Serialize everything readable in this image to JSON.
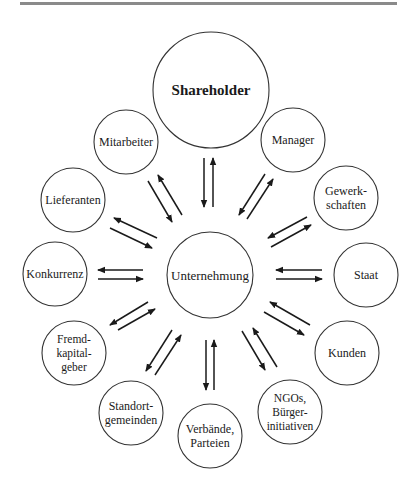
{
  "diagram": {
    "center": {
      "label": "Unternehmung",
      "x": 210,
      "y": 275,
      "r": 43
    },
    "shareholder": {
      "label": "Shareholder",
      "x": 211,
      "y": 90,
      "r": 58,
      "bold": true
    },
    "stakeholders": [
      {
        "id": "mitarbeiter",
        "lines": [
          "Mitarbeiter"
        ],
        "x": 126,
        "y": 142,
        "r": 32
      },
      {
        "id": "manager",
        "lines": [
          "Manager"
        ],
        "x": 293,
        "y": 140,
        "r": 32
      },
      {
        "id": "lieferanten",
        "lines": [
          "Lieferanten"
        ],
        "x": 73,
        "y": 200,
        "r": 32
      },
      {
        "id": "gewerkschaften",
        "lines": [
          "Gewerk-",
          "schaften"
        ],
        "x": 346,
        "y": 198,
        "r": 32
      },
      {
        "id": "konkurrenz",
        "lines": [
          "Konkurrenz"
        ],
        "x": 55,
        "y": 274,
        "r": 32
      },
      {
        "id": "staat",
        "lines": [
          "Staat"
        ],
        "x": 366,
        "y": 275,
        "r": 32
      },
      {
        "id": "fremdkapitalgeber",
        "lines": [
          "Fremd-",
          "kapital-",
          "geber"
        ],
        "x": 74,
        "y": 353,
        "r": 32
      },
      {
        "id": "kunden",
        "lines": [
          "Kunden"
        ],
        "x": 347,
        "y": 353,
        "r": 32
      },
      {
        "id": "standortgemeinden",
        "lines": [
          "Standort-",
          "gemeinden"
        ],
        "x": 131,
        "y": 413,
        "r": 32
      },
      {
        "id": "verbaende",
        "lines": [
          "Verbände,",
          "Parteien"
        ],
        "x": 210,
        "y": 436,
        "r": 32
      },
      {
        "id": "ngos",
        "lines": [
          "NGOs,",
          "Bürger-",
          "initiativen"
        ],
        "x": 290,
        "y": 412,
        "r": 32
      }
    ],
    "arrows": [
      {
        "from": "shareholder",
        "x1": 204,
        "y1": 158,
        "x2": 204,
        "y2": 207
      },
      {
        "from": "unternehmung",
        "x1": 213,
        "y1": 207,
        "x2": 213,
        "y2": 158
      },
      {
        "from": "mitarbeiter",
        "x1": 148,
        "y1": 181,
        "x2": 172,
        "y2": 222
      },
      {
        "from": "unternehmung",
        "x1": 182,
        "y1": 215,
        "x2": 158,
        "y2": 175
      },
      {
        "from": "manager",
        "x1": 265,
        "y1": 174,
        "x2": 239,
        "y2": 215
      },
      {
        "from": "unternehmung",
        "x1": 247,
        "y1": 219,
        "x2": 273,
        "y2": 179
      },
      {
        "from": "unternehmung",
        "x1": 157,
        "y1": 238,
        "x2": 114,
        "y2": 218
      },
      {
        "from": "lieferanten",
        "x1": 110,
        "y1": 228,
        "x2": 152,
        "y2": 248
      },
      {
        "from": "gewerkschaften",
        "x1": 307,
        "y1": 217,
        "x2": 268,
        "y2": 238
      },
      {
        "from": "unternehmung",
        "x1": 271,
        "y1": 247,
        "x2": 311,
        "y2": 225
      },
      {
        "from": "unternehmung",
        "x1": 143,
        "y1": 270,
        "x2": 98,
        "y2": 270
      },
      {
        "from": "konkurrenz",
        "x1": 98,
        "y1": 279,
        "x2": 143,
        "y2": 279
      },
      {
        "from": "staat",
        "x1": 322,
        "y1": 270,
        "x2": 276,
        "y2": 270
      },
      {
        "from": "unternehmung",
        "x1": 276,
        "y1": 279,
        "x2": 322,
        "y2": 279
      },
      {
        "from": "unternehmung",
        "x1": 148,
        "y1": 302,
        "x2": 110,
        "y2": 325
      },
      {
        "from": "fremdkapitalgeber",
        "x1": 118,
        "y1": 330,
        "x2": 155,
        "y2": 309
      },
      {
        "from": "kunden",
        "x1": 310,
        "y1": 325,
        "x2": 270,
        "y2": 302
      },
      {
        "from": "unternehmung",
        "x1": 264,
        "y1": 312,
        "x2": 304,
        "y2": 335
      },
      {
        "from": "unternehmung",
        "x1": 172,
        "y1": 330,
        "x2": 146,
        "y2": 371
      },
      {
        "from": "standortgemeinden",
        "x1": 155,
        "y1": 375,
        "x2": 181,
        "y2": 335
      },
      {
        "from": "unternehmung",
        "x1": 206,
        "y1": 340,
        "x2": 206,
        "y2": 390
      },
      {
        "from": "verbaende",
        "x1": 214,
        "y1": 390,
        "x2": 214,
        "y2": 340
      },
      {
        "from": "unternehmung",
        "x1": 242,
        "y1": 331,
        "x2": 265,
        "y2": 370
      },
      {
        "from": "ngos",
        "x1": 277,
        "y1": 367,
        "x2": 253,
        "y2": 328
      }
    ]
  }
}
